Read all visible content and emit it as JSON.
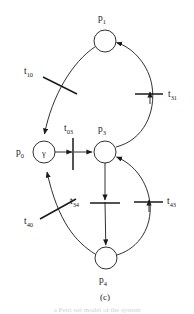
{
  "figure": {
    "caption": "(c)",
    "type": "petri-net",
    "bottom_partial_text": "a  Petri  net   model   of   the  system",
    "stroke_color": "#1a1a1a",
    "background_color": "#ffffff",
    "places": [
      {
        "id": "p0",
        "label": "p",
        "sub": "0",
        "cx": 44,
        "cy": 152,
        "r": 11,
        "token": "γ",
        "label_x": 20,
        "label_y": 155
      },
      {
        "id": "p1",
        "label": "p",
        "sub": "1",
        "cx": 105,
        "cy": 41,
        "r": 11,
        "token": "",
        "label_x": 101,
        "label_y": 19
      },
      {
        "id": "p3",
        "label": "p",
        "sub": "3",
        "cx": 105,
        "cy": 152,
        "r": 11,
        "token": "",
        "label_x": 101,
        "label_y": 130
      },
      {
        "id": "p4",
        "label": "p",
        "sub": "4",
        "cx": 106,
        "cy": 258,
        "r": 11,
        "token": "",
        "label_x": 102,
        "label_y": 283
      }
    ],
    "transitions": [
      {
        "id": "t10",
        "label": "t",
        "sub": "10",
        "label_x": 24,
        "label_y": 74,
        "orientation": "diagonal"
      },
      {
        "id": "t31",
        "label": "t",
        "sub": "31",
        "label_x": 166,
        "label_y": 96,
        "orientation": "horizontal"
      },
      {
        "id": "t03",
        "label": "t",
        "sub": "03",
        "label_x": 62,
        "label_y": 130,
        "orientation": "vertical"
      },
      {
        "id": "t34",
        "label": "t",
        "sub": "34",
        "label_x": 71,
        "label_y": 203,
        "orientation": "horizontal"
      },
      {
        "id": "t43",
        "label": "t",
        "sub": "43",
        "label_x": 166,
        "label_y": 203,
        "orientation": "horizontal"
      },
      {
        "id": "t40",
        "label": "t",
        "sub": "40",
        "label_x": 25,
        "label_y": 223,
        "orientation": "diagonal"
      }
    ],
    "arcs": [
      {
        "from": "p1",
        "to": "p0",
        "via": "t10",
        "shape": "arc-left"
      },
      {
        "from": "p3",
        "to": "p1",
        "via": "t31",
        "shape": "arc-right"
      },
      {
        "from": "p0",
        "to": "p3",
        "via": "t03",
        "shape": "straight-horizontal"
      },
      {
        "from": "p3",
        "to": "p4",
        "via": "t34",
        "shape": "straight-vertical"
      },
      {
        "from": "p4",
        "to": "p3",
        "via": "t43",
        "shape": "arc-right"
      },
      {
        "from": "p4",
        "to": "p0",
        "via": "t40",
        "shape": "arc-left"
      }
    ]
  }
}
